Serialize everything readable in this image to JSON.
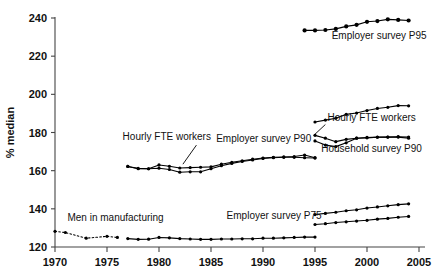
{
  "chart_data": {
    "type": "line",
    "title": "",
    "subtitle": "",
    "xlabel": "",
    "ylabel": "% median",
    "xlim": [
      1970,
      2005
    ],
    "ylim": [
      120,
      240
    ],
    "xticks": [
      1970,
      1975,
      1980,
      1985,
      1990,
      1995,
      2000,
      2005
    ],
    "xtick_labels": [
      "1970",
      "1975",
      "1980",
      "1985",
      "1990",
      "1995",
      "2000",
      "2005"
    ],
    "yticks": [
      120,
      140,
      160,
      180,
      200,
      220,
      240
    ],
    "ytick_labels": [
      "120",
      "140",
      "160",
      "180",
      "200",
      "220",
      "240"
    ],
    "grid": false,
    "legend_position": "none (inline annotations)",
    "marker": "filled-circle",
    "series": [
      {
        "name": "Employer survey P95",
        "style": "solid",
        "x": [
          1994,
          1995,
          1996,
          1997,
          1998,
          1999,
          2000,
          2001,
          2002,
          2003,
          2004
        ],
        "values": [
          233.5,
          233.5,
          233.7,
          234.3,
          235.6,
          236.4,
          238.0,
          238.4,
          239.3,
          239.0,
          238.7
        ]
      },
      {
        "name": "Hourly FTE workers (upper, late period)",
        "style": "solid",
        "x": [
          1995,
          1996,
          1997,
          1998,
          1999,
          2000,
          2001,
          2002,
          2003,
          2004
        ],
        "values": [
          185.5,
          186.5,
          187.5,
          189.5,
          190.2,
          191.5,
          192.6,
          193.2,
          194.1,
          194.0
        ]
      },
      {
        "name": "Household survey P90 (upper branch)",
        "style": "solid",
        "x": [
          1995,
          1996,
          1997,
          1998,
          1999,
          2000,
          2001,
          2002,
          2003,
          2004
        ],
        "values": [
          178.5,
          177.0,
          175.2,
          176.4,
          177.0,
          177.4,
          177.6,
          177.6,
          177.8,
          177.6
        ]
      },
      {
        "name": "Household survey P90 (lower branch)",
        "style": "solid",
        "x": [
          1995,
          1996,
          1997,
          1998,
          1999,
          2000,
          2001,
          2002,
          2003,
          2004
        ],
        "values": [
          175.6,
          173.4,
          172.6,
          174.6,
          177.0,
          177.2,
          177.5,
          177.6,
          177.6,
          177.0
        ]
      },
      {
        "name": "Employer survey P90 (upper)",
        "style": "solid",
        "x": [
          1977,
          1978,
          1979,
          1980,
          1981,
          1982,
          1983,
          1984,
          1985,
          1986,
          1987,
          1988,
          1989,
          1990,
          1991,
          1992,
          1993,
          1994,
          1995
        ],
        "values": [
          162.2,
          161.2,
          161.0,
          163.0,
          162.3,
          161.4,
          161.6,
          161.8,
          162.0,
          163.4,
          164.4,
          165.2,
          166.0,
          166.6,
          167.0,
          167.2,
          167.4,
          168.2,
          166.8
        ]
      },
      {
        "name": "Hourly FTE workers (lower, early period)",
        "style": "solid",
        "x": [
          1977,
          1978,
          1979,
          1980,
          1981,
          1982,
          1983,
          1984,
          1985,
          1986,
          1987,
          1988,
          1989,
          1990,
          1991,
          1992,
          1993,
          1994,
          1995
        ],
        "values": [
          162.2,
          161.0,
          161.0,
          161.3,
          160.6,
          159.2,
          159.4,
          159.4,
          161.0,
          162.6,
          163.8,
          164.8,
          165.6,
          166.4,
          166.8,
          167.0,
          167.0,
          166.8,
          166.6
        ]
      },
      {
        "name": "Employer survey P75 (upper, late period)",
        "style": "solid",
        "x": [
          1995,
          1996,
          1997,
          1998,
          1999,
          2000,
          2001,
          2002,
          2003,
          2004
        ],
        "values": [
          137.0,
          137.6,
          138.2,
          139.0,
          139.5,
          140.4,
          141.0,
          141.6,
          142.2,
          142.6
        ]
      },
      {
        "name": "Employer survey P75 (lower, late period)",
        "style": "solid",
        "x": [
          1995,
          1996,
          1997,
          1998,
          1999,
          2000,
          2001,
          2002,
          2003,
          2004
        ],
        "values": [
          131.8,
          132.2,
          132.8,
          133.2,
          133.6,
          134.0,
          134.6,
          135.0,
          135.6,
          136.0
        ]
      },
      {
        "name": "Men in manufacturing (dotted, early)",
        "style": "dotted",
        "x": [
          1970,
          1971,
          1973,
          1975,
          1976
        ],
        "values": [
          128.2,
          127.6,
          124.6,
          125.6,
          125.0
        ]
      },
      {
        "name": "Men in manufacturing (solid)",
        "style": "solid",
        "x": [
          1977,
          1978,
          1979,
          1980,
          1981,
          1982,
          1983,
          1984,
          1985,
          1986,
          1987,
          1988,
          1989,
          1990,
          1991,
          1992,
          1993,
          1994,
          1995
        ],
        "values": [
          124.4,
          124.0,
          124.1,
          125.0,
          124.8,
          124.4,
          124.2,
          124.0,
          124.0,
          124.2,
          124.2,
          124.3,
          124.3,
          124.6,
          124.6,
          124.8,
          125.0,
          125.2,
          125.2
        ]
      }
    ],
    "annotations": [
      {
        "text": "Employer survey P95",
        "x": 1996.6,
        "y": 229.0
      },
      {
        "text": "Hourly FTE workers",
        "x": 1996.2,
        "y": 186.0
      },
      {
        "text": "Household survey P90",
        "x": 1995.6,
        "y": 170.0
      },
      {
        "text": "Employer survey P90",
        "x": 1985.5,
        "y": 175.0
      },
      {
        "text": "Hourly FTE workers",
        "x": 1976.5,
        "y": 176.0
      },
      {
        "text": "Employer survey P75",
        "x": 1986.5,
        "y": 134.5
      },
      {
        "text": "Men in manufacturing",
        "x": 1971.2,
        "y": 133.5
      }
    ]
  },
  "axis": {
    "y_title": "% median"
  }
}
